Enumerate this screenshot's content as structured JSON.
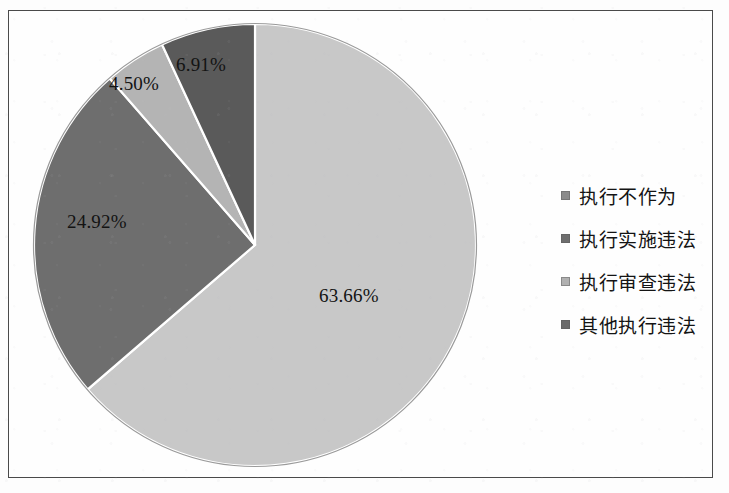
{
  "chart_data": {
    "type": "pie",
    "title": "",
    "categories": [
      "执行不作为",
      "执行实施违法",
      "执行审查违法",
      "其他执行违法"
    ],
    "values": [
      63.66,
      24.92,
      4.5,
      6.91
    ],
    "value_labels": [
      "63.66%",
      "24.92%",
      "4.50%",
      "6.91%"
    ],
    "unit": "%",
    "colors": [
      "#c8c8c8",
      "#6e6e6e",
      "#b4b4b4",
      "#5a5a5a"
    ],
    "start_angle_deg": 0,
    "direction": "clockwise",
    "legend_position": "right",
    "grid": false,
    "border_color": "#4a4a4a",
    "background": "#fefefe",
    "slices": [
      {
        "label": "执行不作为",
        "value": 63.66,
        "value_label": "63.66%",
        "color": "#c8c8c8"
      },
      {
        "label": "执行实施违法",
        "value": 24.92,
        "value_label": "24.92%",
        "color": "#6e6e6e"
      },
      {
        "label": "执行审查违法",
        "value": 4.5,
        "value_label": "4.50%",
        "color": "#b4b4b4"
      },
      {
        "label": "其他执行违法",
        "value": 6.91,
        "value_label": "6.91%",
        "color": "#5a5a5a"
      }
    ]
  },
  "legend": {
    "items": [
      {
        "label": "执行不作为",
        "color": "#8a8a8a"
      },
      {
        "label": "执行实施违法",
        "color": "#6e6e6e"
      },
      {
        "label": "执行审查违法",
        "color": "#b0b0b0"
      },
      {
        "label": "其他执行违法",
        "color": "#6a6a6a"
      }
    ]
  }
}
